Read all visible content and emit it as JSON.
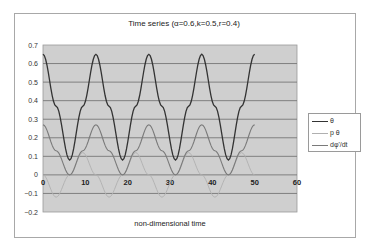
{
  "chart_data": {
    "type": "line",
    "title": "Time series (α=0.6,k=0.5,r=0.4)",
    "xlabel": "non-dimensional time",
    "ylabel": "",
    "xlim": [
      0,
      60
    ],
    "ylim": [
      -0.2,
      0.7
    ],
    "xticks": [
      "0",
      "10",
      "20",
      "30",
      "40",
      "50",
      "60"
    ],
    "yticks": [
      "0.7",
      "0.6",
      "0.5",
      "0.4",
      "0.3",
      "0.2",
      "0.1",
      "0",
      "-0.1",
      "-0.2"
    ],
    "grid": "horizontal",
    "legend_position": "right",
    "plot_background": "#cfcfcf",
    "series": [
      {
        "name": "θ",
        "color": "#333333",
        "x": [
          0,
          3.1,
          6.3,
          9.4,
          12.5,
          15.6,
          18.8,
          21.9,
          25,
          28.1,
          31.3,
          34.4,
          37.5,
          40.6,
          43.8,
          46.9,
          50
        ],
        "values": [
          0.65,
          0.37,
          0.08,
          0.37,
          0.65,
          0.37,
          0.08,
          0.37,
          0.65,
          0.37,
          0.08,
          0.37,
          0.65,
          0.37,
          0.08,
          0.37,
          0.65
        ]
      },
      {
        "name": "p θ",
        "color": "#b0b0b0",
        "x": [
          0,
          3.1,
          6.3,
          9.4,
          12.5,
          15.6,
          18.8,
          21.9,
          25,
          28.1,
          31.3,
          34.4,
          37.5,
          40.6,
          43.8,
          46.9,
          50
        ],
        "values": [
          0.0,
          -0.12,
          0.0,
          0.12,
          0.0,
          -0.12,
          0.0,
          0.12,
          0.0,
          -0.12,
          0.0,
          0.12,
          0.0,
          -0.12,
          0.0,
          0.12,
          0.0
        ]
      },
      {
        "name": "dφ'/dt",
        "color": "#7a7a7a",
        "x": [
          0,
          3.1,
          6.3,
          9.4,
          12.5,
          15.6,
          18.8,
          21.9,
          25,
          28.1,
          31.3,
          34.4,
          37.5,
          40.6,
          43.8,
          46.9,
          50
        ],
        "values": [
          0.27,
          0.13,
          0.0,
          0.13,
          0.27,
          0.13,
          0.0,
          0.13,
          0.27,
          0.13,
          0.0,
          0.13,
          0.27,
          0.13,
          0.0,
          0.13,
          0.27
        ]
      }
    ]
  },
  "legend": {
    "items": [
      {
        "label": "θ",
        "color": "#333333"
      },
      {
        "label": "p θ",
        "color": "#b0b0b0"
      },
      {
        "label": "dφ'/dt",
        "color": "#7a7a7a"
      }
    ]
  }
}
